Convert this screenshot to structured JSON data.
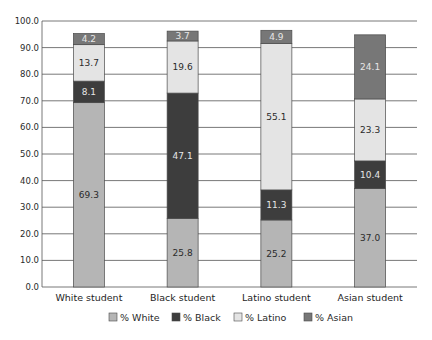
{
  "chart_data": {
    "type": "bar",
    "stacked": true,
    "title": "",
    "xlabel": "",
    "ylabel": "",
    "ylim": [
      0,
      100
    ],
    "yticks": [
      "0.0",
      "10.0",
      "20.0",
      "30.0",
      "40.0",
      "50.0",
      "60.0",
      "70.0",
      "80.0",
      "90.0",
      "100.0"
    ],
    "grid": true,
    "legend_position": "bottom",
    "categories": [
      "White student",
      "Black student",
      "Latino student",
      "Asian student"
    ],
    "series": [
      {
        "name": "% White",
        "color": "#b5b5b5",
        "label_color": "#2a2a2a",
        "values": [
          69.3,
          25.8,
          25.2,
          37.0
        ]
      },
      {
        "name": "% Black",
        "color": "#3d3d3d",
        "label_color": "#e6e6e6",
        "values": [
          8.1,
          47.1,
          11.3,
          10.4
        ]
      },
      {
        "name": "% Latino",
        "color": "#e4e4e4",
        "label_color": "#2a2a2a",
        "values": [
          13.7,
          19.6,
          55.1,
          23.3
        ]
      },
      {
        "name": "% Asian",
        "color": "#777777",
        "label_color": "#e6e6e6",
        "values": [
          4.2,
          3.7,
          4.9,
          24.1
        ]
      }
    ]
  }
}
